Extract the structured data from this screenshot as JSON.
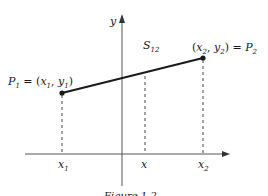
{
  "figure": {
    "axis_labels": {
      "y": "y"
    },
    "segment_label": {
      "main": "S",
      "sub": "12"
    },
    "point1": {
      "name": "P",
      "name_sub": "1",
      "eq": " = (",
      "x": "x",
      "x_sub": "1",
      "sep": ", ",
      "y": "y",
      "y_sub": "1",
      "close": ")"
    },
    "point2": {
      "open": "(",
      "x": "x",
      "x_sub": "2",
      "sep": ", ",
      "y": "y",
      "y_sub": "2",
      "eq": ") = ",
      "name": "P",
      "name_sub": "2"
    },
    "tick_labels": {
      "x1": {
        "main": "x",
        "sub": "1"
      },
      "x": {
        "main": "x"
      },
      "x2": {
        "main": "x",
        "sub": "2"
      }
    },
    "caption": "Figure 1.2",
    "colors": {
      "ink": "#1a1a1a",
      "axis": "#555555"
    }
  }
}
